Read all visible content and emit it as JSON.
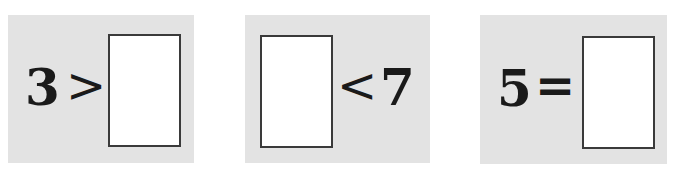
{
  "exercises": [
    {
      "left": "3",
      "operator": ">",
      "right": "",
      "blank_position": "right"
    },
    {
      "left": "",
      "operator": "<",
      "right": "7",
      "blank_position": "left"
    },
    {
      "left": "5",
      "operator": "=",
      "right": "",
      "blank_position": "right"
    }
  ],
  "colors": {
    "panel_bg": "#e3e3e3",
    "box_bg": "#ffffff",
    "box_border": "#3a3a3a",
    "text": "#1a1a1a"
  }
}
